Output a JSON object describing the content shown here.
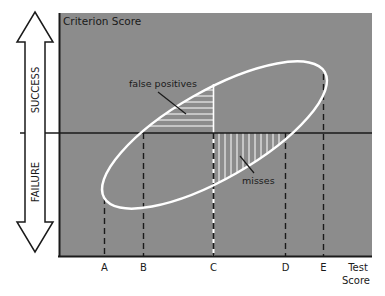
{
  "diagram": {
    "y_axis_title": "Criterion Score",
    "x_axis_title_line1": "Test",
    "x_axis_title_line2": "Score",
    "arrow_up_label": "SUCCESS",
    "arrow_down_label": "FAILURE",
    "region_false_positives": "false positives",
    "region_misses": "misses",
    "cutoff_labels": [
      "A",
      "B",
      "C",
      "D",
      "E"
    ],
    "colors": {
      "panel": "#8c8c8c",
      "ellipse": "#ffffff",
      "axis": "#1a1a1a",
      "background": "#ffffff"
    }
  }
}
